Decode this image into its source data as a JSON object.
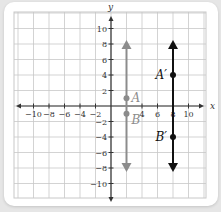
{
  "figure": {
    "type": "coordinate-plane",
    "axes": {
      "x_label": "x",
      "y_label": "y",
      "x_ticks": [
        "-10",
        "-8",
        "-6",
        "-4",
        "-2",
        "4",
        "6",
        "8",
        "10"
      ],
      "y_ticks": [
        "10",
        "8",
        "6",
        "4",
        "2",
        "-2",
        "-4",
        "-6",
        "-8",
        "-10"
      ],
      "range": [
        -12,
        12
      ],
      "grid_step": 2
    },
    "original_line": {
      "color": "#8c8c8c",
      "x": 2,
      "y_from": -8,
      "y_to": 8,
      "points": [
        {
          "label": "A",
          "x": 2,
          "y": 1
        },
        {
          "label": "B",
          "x": 2,
          "y": -1
        }
      ]
    },
    "image_line": {
      "color": "#111111",
      "x": 8,
      "y_from": -8,
      "y_to": 8,
      "points": [
        {
          "label": "A′",
          "x": 8,
          "y": 4
        },
        {
          "label": "B′",
          "x": 8,
          "y": -4
        }
      ]
    },
    "colors": {
      "grid": "#c8c8c8",
      "axis": "#333333",
      "background": "#ffffff",
      "page": "#e6e6e6"
    }
  }
}
